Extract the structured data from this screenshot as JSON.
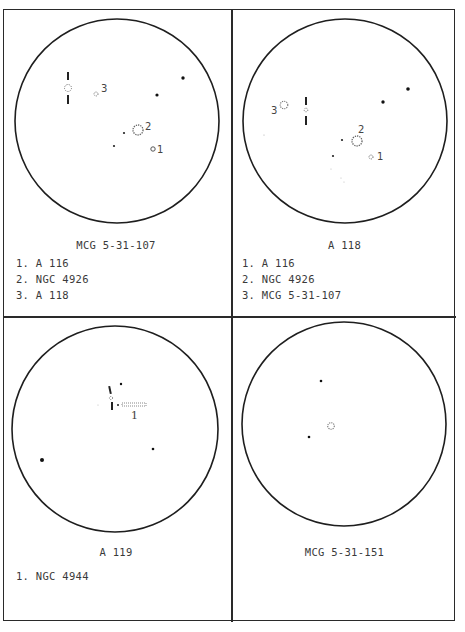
{
  "panels": [
    {
      "title": "MCG 5-31-107",
      "legend": [
        "1. A 116",
        "2. NGC 4926",
        "3. A 118"
      ],
      "labels": [
        "1",
        "2",
        "3"
      ]
    },
    {
      "title": "A 118",
      "legend": [
        "1. A 116",
        "2. NGC 4926",
        "3. MCG 5-31-107"
      ],
      "labels": [
        "1",
        "2",
        "3"
      ]
    },
    {
      "title": "A 119",
      "legend": [
        "1. NGC 4944"
      ],
      "labels": [
        "1"
      ]
    },
    {
      "title": "MCG 5-31-151",
      "legend": [],
      "labels": []
    }
  ]
}
